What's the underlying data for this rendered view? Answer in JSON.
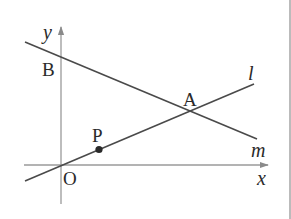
{
  "diagram": {
    "type": "coordinate-geometry",
    "axes": {
      "x_label": "x",
      "y_label": "y",
      "origin_label": "O"
    },
    "lines": [
      {
        "id": "l",
        "label": "l",
        "passes_through": [
          "O",
          "P",
          "A"
        ]
      },
      {
        "id": "m",
        "label": "m",
        "passes_through": [
          "B",
          "A"
        ]
      }
    ],
    "points": [
      {
        "id": "A",
        "label": "A",
        "description": "intersection of l and m"
      },
      {
        "id": "B",
        "label": "B",
        "description": "y-intercept of m"
      },
      {
        "id": "P",
        "label": "P",
        "description": "point on l",
        "marked": true
      },
      {
        "id": "O",
        "label": "O",
        "description": "origin"
      }
    ],
    "colors": {
      "axis": "#9a9a9a",
      "line": "#4a4a4a",
      "label": "#2a2a2a",
      "border": "#9e9e9e",
      "background": "#ffffff"
    }
  }
}
